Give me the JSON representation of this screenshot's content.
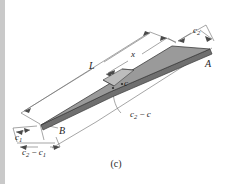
{
  "figure": {
    "caption": "(c)",
    "type": "isometric-tapered-beam-diagram",
    "colors": {
      "top_face": "#9a9a9a",
      "segment_face": "#b8b8b8",
      "side_face": "#6f6f6f",
      "outline": "#3c3c3c",
      "dimension_line": "#5a5a5a",
      "background": "#ffffff",
      "gutter": "#c9c9c9",
      "text": "#1d1d1d"
    },
    "labels": {
      "width_right": {
        "base": "c",
        "sub": "2",
        "text": "c2"
      },
      "width_left": {
        "base": "c",
        "sub": "1",
        "text": "c1"
      },
      "width_diff_left": {
        "text": "c2 − c1",
        "base": "c",
        "sub": "2",
        "op": " − ",
        "base2": "c",
        "sub2": "1"
      },
      "width_mid": {
        "base": "c",
        "sub": "",
        "text": "c"
      },
      "width_diff_mid": {
        "text": "c2 − c",
        "base": "c",
        "sub": "2",
        "op": " − ",
        "base2": "c"
      },
      "length_full": {
        "text": "L"
      },
      "length_partial": {
        "text": "x"
      },
      "point_right": {
        "text": "A"
      },
      "point_left": {
        "text": "B"
      }
    },
    "dimensions": [
      {
        "name": "L",
        "label": "L",
        "description": "full length of tapered beam"
      },
      {
        "name": "x",
        "label": "x",
        "description": "distance from right end A to section"
      },
      {
        "name": "c2",
        "label": "c2",
        "description": "half-width at right end A"
      },
      {
        "name": "c1",
        "label": "c1",
        "description": "half-width at left end B"
      },
      {
        "name": "c2-c1",
        "label": "c2 − c1",
        "description": "taper difference at left end"
      },
      {
        "name": "c",
        "label": "c",
        "description": "half-width at intermediate section"
      },
      {
        "name": "c2-c",
        "label": "c2 − c",
        "description": "taper difference at intermediate section"
      }
    ],
    "points": [
      {
        "name": "A",
        "label": "A",
        "description": "right end corner of beam"
      },
      {
        "name": "B",
        "label": "B",
        "description": "left end corner of beam"
      }
    ]
  }
}
